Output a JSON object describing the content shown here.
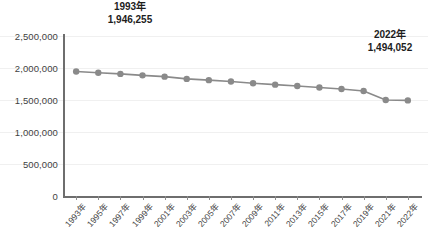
{
  "chart_data": {
    "type": "line",
    "title": "",
    "xlabel": "",
    "ylabel": "",
    "ylim": [
      0,
      2500000
    ],
    "ytick_step": 500000,
    "ytick_labels": [
      "2,500,000",
      "2,000,000",
      "1,500,000",
      "1,000,000",
      "500,000",
      "0"
    ],
    "ytick_values": [
      2500000,
      2000000,
      1500000,
      1000000,
      500000,
      0
    ],
    "grid": true,
    "legend": null,
    "series_color": "#8a8a8a",
    "marker": "circle",
    "categories": [
      "1993年",
      "1995年",
      "1997年",
      "1999年",
      "2001年",
      "2003年",
      "2005年",
      "2007年",
      "2009年",
      "2011年",
      "2013年",
      "2015年",
      "2017年",
      "2019年",
      "2021年",
      "2022年"
    ],
    "x_tick_labels": [
      "1993年",
      "1995年",
      "1997年",
      "1999年",
      "2001年",
      "2003年",
      "2005年",
      "2007年",
      "2009年",
      "2011年",
      "2013年",
      "2015年",
      "2017年",
      "2019年",
      "2021年",
      "2022年"
    ],
    "values": [
      1946255,
      1925000,
      1908000,
      1885000,
      1865000,
      1830000,
      1810000,
      1790000,
      1762000,
      1740000,
      1718000,
      1695000,
      1672000,
      1640000,
      1500000,
      1494052
    ],
    "annotations": [
      {
        "id": "start",
        "year_label": "1993年",
        "value_label": "1,946,255",
        "value": 1946255
      },
      {
        "id": "end",
        "year_label": "2022年",
        "value_label": "1,494,052",
        "value": 1494052
      }
    ]
  },
  "colors": {
    "series": "#8a8a8a",
    "axis": "#6e6e6e",
    "grid": "#f0f0f0",
    "text": "#3f3f3f",
    "annotation": "#1d1d1d",
    "background": "#ffffff"
  }
}
